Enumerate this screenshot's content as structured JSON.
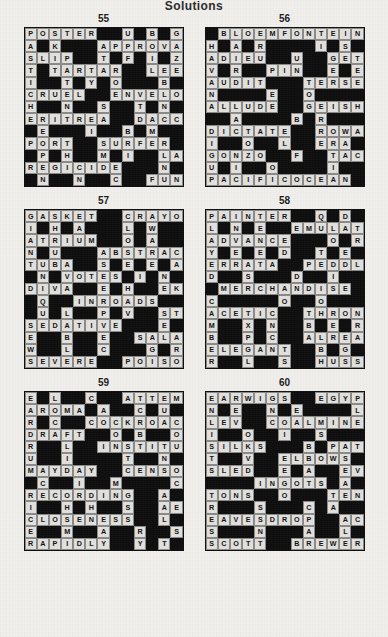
{
  "page": {
    "title": "Solutions"
  },
  "puzzles": [
    {
      "number": "55",
      "rows": [
        "POSTER..U.B.G.",
        "A.K...APPROVAL",
        "SLIP..T.F.I.Z.",
        "T.TARTAR..LEEK",
        "I..T.Y.O...B..",
        "CRUEL..ENVELOP",
        "H..N..S..T.N..L",
        "ERITREA..DACCA",
        ".E...I..B.M..T",
        "PORT..SURFER.Y",
        ".P.H..M.I..LAMP",
        "REGICIDE...N.U",
        ".N..N..C..FUNGUS"
      ]
    },
    {
      "number": "56",
      "rows": [
        ".BLOEMFONTEIN",
        "H.A.R....I.S.A",
        "ADIEU..U..GETUP",
        "V.R..PIN..E.E.P",
        "AUDIT...TERSELY",
        "N....E..O....M.",
        "ALLUDE..GEISHA",
        "..A....B.R....N",
        "DICTATE..ROWAN",
        "I..O..L..ERA.I.O",
        "GONZO..F..TACKY",
        "U.I..O....I..C.S",
        "PACIFICOCEAN."
      ]
    },
    {
      "number": "57",
      "rows": [
        "GASKET..CRAYON",
        "I.H.A...L.W...E",
        "ATRIUM..O.A...A",
        "N.U...ABSTRACT",
        "TUBA..S.E.E.A..",
        ".N.VOTES.I.N.M.",
        "DIVA..E.H..EKED",
        ".Q..INROADS..R.",
        ".U.L..P.V..STAR",
        "SEDATIVE...E.E.",
        "E..B..E..SALAMI",
        "W..L..C...G.R.G",
        "SEVERE..POISON"
      ]
    },
    {
      "number": "58",
      "rows": [
        "PAINTER..Q.D.H",
        "L.N.E..EMULATE",
        "ADVANCE...O.R.I",
        "Y.E.E.D..T.E.F.",
        "ERRATA..PEDDLE",
        "D..S...D..I....R",
        ".MERCHANDISE.",
        "C.....O..O...T.K",
        "ACETIC..THRONE",
        "M..X.N..B.E.R.N",
        "B..P.C..ALREADY",
        "ELEGANT..B.G..A",
        "R..L..S..HUSSEIN"
      ]
    },
    {
      "number": "59",
      "rows": [
        "E.L..C..ATTEMPT",
        "AROMA.A..C.U.I.A",
        "R.C..COCKROACH",
        "DRAFT..O.B..O.O",
        "R..L..INSTITUTE",
        "U..I....T..N...W.",
        "MAYDAY..CENSOR",
        ".C..I..M....C..E",
        "RECORDING..A..L",
        "I..H.H..S..AERIE",
        "CLOSENESS..L..A",
        "E..M..A..R..SPEWS",
        "RAPIDLY..Y.T.E"
      ]
    },
    {
      "number": "60",
      "rows": [
        "EARWIGS..EGYPT",
        "N.E..N.E....L..O",
        "LEV..COALMINER",
        "I..O..I..S...M..C",
        "SILKS...B.PATH",
        "T..V..ELBOWS...",
        "SLED..E.A..EVIL",
        "....INGOTS.A..E",
        "TONS..O...TENON",
        "R...S...C.A..T.G",
        "EAVESDROP..ACT",
        "S...N...A..L..G.H",
        "SCOTT..BREWERY"
      ]
    }
  ],
  "grids": {
    "55": [
      [
        "P",
        "O",
        "S",
        "T",
        "E",
        "R",
        "#",
        "U",
        "#",
        "B",
        "#",
        "G",
        "#"
      ],
      [
        "A",
        "#",
        "K",
        "#",
        "#",
        "A",
        "P",
        "P",
        "R",
        "O",
        "V",
        "A",
        "L"
      ],
      [
        "S",
        "L",
        "I",
        "P",
        "#",
        "T",
        "#",
        "F",
        "#",
        "I",
        "#",
        "Z",
        "#"
      ],
      [
        "T",
        "#",
        "T",
        "A",
        "R",
        "T",
        "A",
        "R",
        "#",
        "#",
        "L",
        "E",
        "E"
      ],
      [
        "I",
        "#",
        "#",
        "T",
        "#",
        "Y",
        "#",
        "O",
        "#",
        "#",
        "#",
        "B",
        "#"
      ],
      [
        "C",
        "R",
        "U",
        "E",
        "L",
        "#",
        "#",
        "E",
        "N",
        "V",
        "E",
        "L",
        "O"
      ],
      [
        "H",
        "#",
        "#",
        "N",
        "#",
        "S",
        "#",
        "#",
        "T",
        "#",
        "N",
        "#",
        "#"
      ],
      [
        "E",
        "R",
        "I",
        "T",
        "R",
        "E",
        "A",
        "#",
        "#",
        "D",
        "A",
        "C",
        "C"
      ],
      [
        "#",
        "E",
        "#",
        "#",
        "#",
        "I",
        "#",
        "#",
        "B",
        "#",
        "M",
        "#",
        "#"
      ],
      [
        "P",
        "O",
        "R",
        "T",
        "#",
        "#",
        "S",
        "U",
        "R",
        "F",
        "E",
        "R",
        "#"
      ],
      [
        "#",
        "P",
        "#",
        "H",
        "#",
        "#",
        "M",
        "#",
        "I",
        "#",
        "#",
        "L",
        "A"
      ],
      [
        "R",
        "E",
        "G",
        "I",
        "C",
        "I",
        "D",
        "E",
        "#",
        "#",
        "#",
        "N",
        "#"
      ],
      [
        "#",
        "N",
        "#",
        "#",
        "N",
        "#",
        "#",
        "C",
        "#",
        "#",
        "F",
        "U",
        "N"
      ]
    ]
  },
  "layout": {
    "columns": 13,
    "rows": 13,
    "puzzles_per_row": 2,
    "puzzle_rows": 3
  },
  "colors": {
    "paper": "#f0efec",
    "block": "#0d0d0d",
    "letter_cell": "#e2e1de",
    "text": "#101010"
  }
}
